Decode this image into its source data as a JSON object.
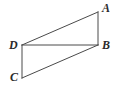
{
  "figure": {
    "background_color": "#ffffff",
    "stroke_color": "#4a4a4a",
    "label_color": "#2b2b2b",
    "stroke_width": 1,
    "vertices": [
      {
        "id": "A",
        "label": "A",
        "x": 98,
        "y": 12,
        "label_x": 102,
        "label_y": 2
      },
      {
        "id": "B",
        "label": "B",
        "x": 98,
        "y": 45,
        "label_x": 102,
        "label_y": 39
      },
      {
        "id": "C",
        "label": "C",
        "x": 22,
        "y": 78,
        "label_x": 10,
        "label_y": 71
      },
      {
        "id": "D",
        "label": "D",
        "x": 22,
        "y": 45,
        "label_x": 9,
        "label_y": 39
      }
    ],
    "segments": [
      {
        "name": "DA",
        "from": "D",
        "to": "A",
        "x1": 22,
        "y1": 45,
        "x2": 98,
        "y2": 12
      },
      {
        "name": "AB",
        "from": "A",
        "to": "B",
        "x1": 98,
        "y1": 12,
        "x2": 98,
        "y2": 45
      },
      {
        "name": "DB",
        "from": "D",
        "to": "B",
        "x1": 22,
        "y1": 45,
        "x2": 98,
        "y2": 45
      },
      {
        "name": "DC",
        "from": "D",
        "to": "C",
        "x1": 22,
        "y1": 45,
        "x2": 22,
        "y2": 78
      },
      {
        "name": "CB",
        "from": "C",
        "to": "B",
        "x1": 22,
        "y1": 78,
        "x2": 98,
        "y2": 45
      }
    ]
  }
}
